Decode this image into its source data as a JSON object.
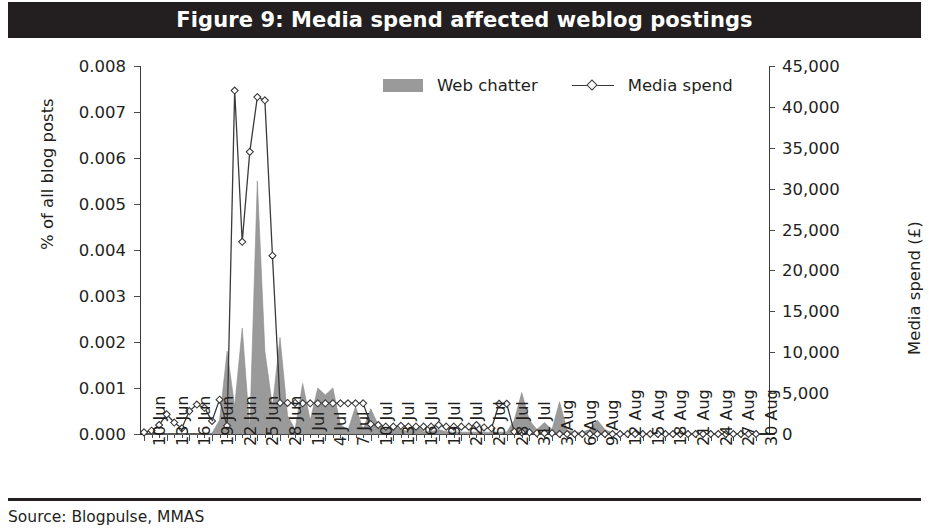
{
  "figure": {
    "title": "Figure 9: Media spend affected weblog postings",
    "source": "Source: Blogpulse, MMAS"
  },
  "legend": {
    "position": "top-center",
    "entries": [
      {
        "label": "Web chatter",
        "marker": "filled-square-swatch",
        "color": "#9a9a9a"
      },
      {
        "label": "Media spend",
        "marker": "line-with-diamond",
        "color": "#3a3a3a"
      }
    ]
  },
  "chart_data": {
    "type": "area",
    "title": "Figure 9: Media spend affected weblog postings",
    "xlabel": "",
    "ylabel": "% of all blog posts",
    "y2label": "Media spend (£)",
    "ylim": [
      0,
      0.008
    ],
    "y2lim": [
      0,
      45000
    ],
    "grid": false,
    "y_ticks": [
      "0.000",
      "0.001",
      "0.002",
      "0.003",
      "0.004",
      "0.005",
      "0.006",
      "0.007",
      "0.008"
    ],
    "y2_ticks": [
      "0",
      "5,000",
      "10,000",
      "15,000",
      "20,000",
      "25,000",
      "30,000",
      "35,000",
      "40,000",
      "45,000"
    ],
    "x_tick_labels": [
      "10 Jun",
      "13 Jun",
      "16 Jun",
      "19 Jun",
      "22 Jun",
      "25 Jun",
      "28 Jun",
      "1 Jul",
      "4 Jul",
      "7 Jul",
      "10 Jul",
      "13 Jul",
      "16 Jul",
      "19 Jul",
      "22 Jul",
      "25 Jul",
      "28 Jul",
      "31 Jul",
      "3 Aug",
      "6 Aug",
      "9 Aug",
      "12 Aug",
      "15 Aug",
      "18 Aug",
      "21 Aug",
      "24 Aug",
      "27 Aug",
      "30 Aug"
    ],
    "x_tick_interval_days": 3,
    "x_range": [
      "10 Jun",
      "30 Aug"
    ],
    "x_points": [
      "10 Jun",
      "11 Jun",
      "12 Jun",
      "13 Jun",
      "14 Jun",
      "15 Jun",
      "16 Jun",
      "17 Jun",
      "18 Jun",
      "19 Jun",
      "20 Jun",
      "21 Jun",
      "22 Jun",
      "23 Jun",
      "24 Jun",
      "25 Jun",
      "26 Jun",
      "27 Jun",
      "28 Jun",
      "29 Jun",
      "30 Jun",
      "1 Jul",
      "2 Jul",
      "3 Jul",
      "4 Jul",
      "5 Jul",
      "6 Jul",
      "7 Jul",
      "8 Jul",
      "9 Jul",
      "10 Jul",
      "11 Jul",
      "12 Jul",
      "13 Jul",
      "14 Jul",
      "15 Jul",
      "16 Jul",
      "17 Jul",
      "18 Jul",
      "19 Jul",
      "20 Jul",
      "21 Jul",
      "22 Jul",
      "23 Jul",
      "24 Jul",
      "25 Jul",
      "26 Jul",
      "27 Jul",
      "28 Jul",
      "29 Jul",
      "30 Jul",
      "31 Jul",
      "1 Aug",
      "2 Aug",
      "3 Aug",
      "4 Aug",
      "5 Aug",
      "6 Aug",
      "7 Aug",
      "8 Aug",
      "9 Aug",
      "10 Aug",
      "11 Aug",
      "12 Aug",
      "13 Aug",
      "14 Aug",
      "15 Aug",
      "16 Aug",
      "17 Aug",
      "18 Aug",
      "19 Aug",
      "20 Aug",
      "21 Aug",
      "22 Aug",
      "23 Aug",
      "24 Aug",
      "25 Aug",
      "26 Aug",
      "27 Aug",
      "28 Aug",
      "29 Aug",
      "30 Aug"
    ],
    "series": [
      {
        "name": "Web chatter",
        "axis": "left",
        "units": "% of all blog posts",
        "type": "area",
        "color": "#9a9a9a",
        "values": [
          0.0,
          0.0,
          0.0,
          0.0,
          0.0,
          0.0,
          0.0,
          0.0,
          0.0,
          2e-05,
          0.0003,
          0.0018,
          0.0006,
          0.0023,
          0.0001,
          0.0055,
          0.0018,
          0.0006,
          0.0021,
          0.0004,
          0.0001,
          0.0011,
          0.0003,
          0.001,
          0.00085,
          0.001,
          0.0002,
          8e-05,
          0.0006,
          0.0001,
          0.00055,
          0.0002,
          0.0001,
          0.00018,
          0.0001,
          5e-05,
          0.0002,
          5e-05,
          5e-05,
          0.0001,
          5e-05,
          4e-05,
          4e-05,
          4e-05,
          4e-05,
          4e-05,
          4e-05,
          4e-05,
          4e-05,
          0.0003,
          0.0009,
          0.0003,
          0.0001,
          0.00025,
          0.0001,
          0.0007,
          8e-05,
          4e-05,
          4e-05,
          0.0001,
          0.0003,
          0.0001,
          2e-05,
          0.0,
          0.0,
          0.0,
          0.0,
          0.0,
          0.0,
          0.0,
          0.0,
          0.0,
          0.0,
          0.0,
          0.0,
          0.0,
          0.0,
          0.0,
          0.0,
          0.0,
          0.0,
          0.0
        ]
      },
      {
        "name": "Media spend",
        "axis": "right",
        "units": "£",
        "type": "line",
        "color": "#3a3a3a",
        "marker": "diamond",
        "values": [
          200,
          400,
          1100,
          2400,
          1400,
          700,
          2800,
          3600,
          3200,
          1600,
          4200,
          1000,
          42000,
          23500,
          34500,
          41200,
          40800,
          21800,
          3800,
          3800,
          3800,
          3750,
          3750,
          3750,
          3750,
          3750,
          3750,
          3750,
          3750,
          3750,
          1200,
          1100,
          900,
          900,
          1000,
          900,
          900,
          900,
          900,
          1100,
          900,
          900,
          900,
          900,
          1100,
          800,
          700,
          3700,
          3700,
          300,
          200,
          200,
          100,
          100,
          100,
          0,
          0,
          0,
          0,
          0,
          0,
          0,
          0,
          0,
          0,
          0,
          0,
          0,
          0,
          0,
          0,
          0,
          0,
          0,
          0,
          0,
          0,
          0,
          0,
          0,
          0,
          0
        ]
      }
    ]
  }
}
